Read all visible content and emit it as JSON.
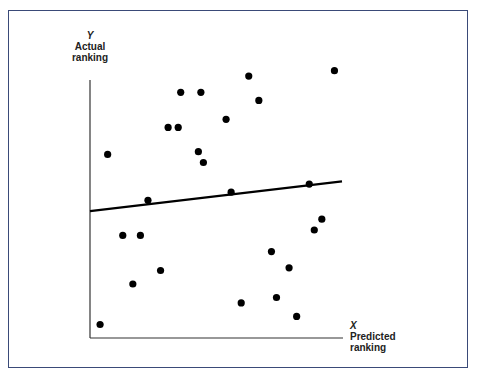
{
  "chart_data": {
    "type": "scatter",
    "title": "",
    "ylabel": {
      "symbol": "Y",
      "line1": "Actual",
      "line2": "ranking"
    },
    "xlabel": {
      "symbol": "X",
      "line1": "Predicted",
      "line2": "ranking"
    },
    "grid": false,
    "legend": null,
    "ticks": "none",
    "xlim": [
      0,
      100
    ],
    "ylim": [
      0,
      100
    ],
    "points": [
      {
        "x": 4,
        "y": 5
      },
      {
        "x": 7,
        "y": 68
      },
      {
        "x": 13,
        "y": 38
      },
      {
        "x": 17,
        "y": 20
      },
      {
        "x": 20,
        "y": 38
      },
      {
        "x": 23,
        "y": 51
      },
      {
        "x": 28,
        "y": 25
      },
      {
        "x": 31,
        "y": 78
      },
      {
        "x": 35,
        "y": 78
      },
      {
        "x": 36,
        "y": 91
      },
      {
        "x": 43,
        "y": 69
      },
      {
        "x": 44,
        "y": 91
      },
      {
        "x": 45,
        "y": 65
      },
      {
        "x": 54,
        "y": 81
      },
      {
        "x": 56,
        "y": 54
      },
      {
        "x": 60,
        "y": 13
      },
      {
        "x": 63,
        "y": 97
      },
      {
        "x": 67,
        "y": 88
      },
      {
        "x": 72,
        "y": 32
      },
      {
        "x": 74,
        "y": 15
      },
      {
        "x": 79,
        "y": 26
      },
      {
        "x": 82,
        "y": 8
      },
      {
        "x": 87,
        "y": 57
      },
      {
        "x": 89,
        "y": 40
      },
      {
        "x": 92,
        "y": 44
      },
      {
        "x": 97,
        "y": 99
      }
    ],
    "regression_line": {
      "x0": 0,
      "y0": 47,
      "x1": 100,
      "y1": 58
    },
    "frame_color": "#3a4a78"
  }
}
